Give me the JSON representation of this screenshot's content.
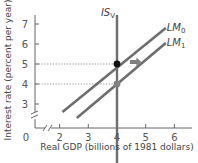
{
  "chart_data": {
    "type": "line",
    "title": "",
    "xlabel": "Real GDP (billions of 1981 dollars)",
    "ylabel": "Interest rate (percent per year)",
    "xlim": [
      0,
      6.7
    ],
    "ylim": [
      0,
      7.5
    ],
    "origin_label": "0",
    "x_ticks": [
      2,
      3,
      4,
      5,
      6
    ],
    "x_tick_labels": [
      "2",
      "3",
      "4",
      "5",
      "6"
    ],
    "y_ticks": [
      3,
      4,
      5,
      6,
      7
    ],
    "y_tick_labels": [
      "3",
      "4",
      "5",
      "6",
      "7"
    ],
    "axis_breaks": true,
    "grid": false,
    "series": [
      {
        "name": "IS",
        "label": "IS",
        "label_sub": "V",
        "points": [
          [
            4,
            7.45
          ],
          [
            4,
            0
          ]
        ],
        "color": "#6e6e6e"
      },
      {
        "name": "LM0",
        "label": "LM",
        "label_sub": "0",
        "points": [
          [
            2.1,
            2.6
          ],
          [
            5.7,
            6.8
          ]
        ],
        "color": "#6e6e6e"
      },
      {
        "name": "LM1",
        "label": "LM",
        "label_sub": "1",
        "points": [
          [
            2.6,
            2.3
          ],
          [
            5.7,
            6.05
          ]
        ],
        "color": "#6e6e6e"
      }
    ],
    "equilibria": [
      {
        "name": "initial",
        "x": 4,
        "y": 5,
        "color": "#111111"
      },
      {
        "name": "new",
        "x": 4,
        "y": 4,
        "color": "#808080"
      }
    ],
    "reference_lines": [
      {
        "axis": "y",
        "value": 5,
        "to_x": 4
      },
      {
        "axis": "y",
        "value": 4,
        "to_x": 4
      }
    ],
    "annotations": [
      {
        "type": "arrow",
        "description": "LM curve shifts right",
        "from": [
          4.45,
          5.1
        ],
        "to": [
          4.85,
          5.1
        ],
        "color": "#808080"
      }
    ]
  }
}
